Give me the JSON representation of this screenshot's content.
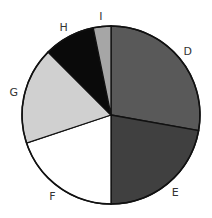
{
  "chart_data": {
    "type": "pie",
    "title": "",
    "categories": [
      "D",
      "E",
      "F",
      "G",
      "H",
      "I"
    ],
    "values": [
      27.8,
      22.2,
      19.9,
      17.6,
      9.3,
      3.2
    ],
    "colors": [
      "#595959",
      "#404040",
      "#ffffff",
      "#d0d0d0",
      "#0a0a0a",
      "#a6a6a6"
    ],
    "start_angle": "12 o'clock",
    "direction": "clockwise",
    "legend": "none (direct labels outside slices)"
  }
}
